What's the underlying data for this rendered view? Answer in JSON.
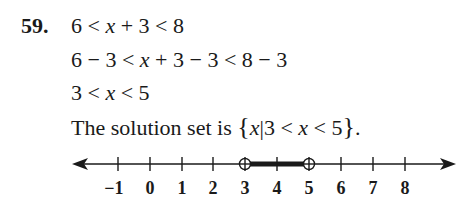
{
  "problem": {
    "number": "59.",
    "steps": [
      {
        "parts": [
          "6 < ",
          "x",
          " + 3 < 8"
        ]
      },
      {
        "parts": [
          "6 − 3 < ",
          "x",
          " + 3 − 3 < 8 − 3"
        ]
      },
      {
        "parts": [
          "3 < ",
          "x",
          " < 5"
        ]
      }
    ],
    "solution": {
      "prefix": "The solution set is ",
      "open_brace": "{",
      "var": "x",
      "bar": "|",
      "condition_a": "3 < ",
      "condition_var": "x",
      "condition_b": " < 5",
      "close_brace": "}",
      "period": "."
    }
  },
  "number_line": {
    "tick_labels": [
      "−1",
      "0",
      "1",
      "2",
      "3",
      "4",
      "5",
      "6",
      "7",
      "8"
    ],
    "interval": {
      "from": "3",
      "to": "5",
      "left_endpoint": "open",
      "right_endpoint": "open"
    }
  }
}
